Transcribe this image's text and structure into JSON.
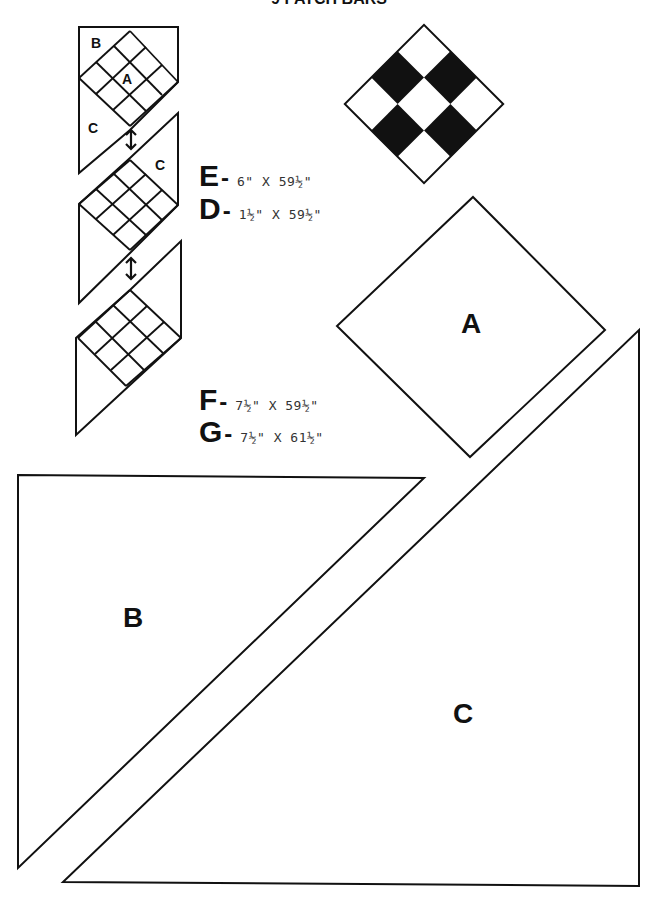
{
  "title": "9 PATCH BARS",
  "assembly_diagram": {
    "labels": {
      "b": "B",
      "a": "A",
      "c1": "C",
      "c2": "C"
    },
    "arrows": [
      "double-arrow",
      "double-arrow"
    ]
  },
  "nine_patch_block": {
    "grid": [
      [
        "white",
        "black",
        "white"
      ],
      [
        "black",
        "white",
        "black"
      ],
      [
        "white",
        "black",
        "white"
      ]
    ],
    "colors": {
      "dark": "#111111",
      "light": "#ffffff"
    }
  },
  "cut_list": [
    {
      "letter": "E",
      "dash": "-",
      "dimensions": "6\" X 59½\""
    },
    {
      "letter": "D",
      "dash": "-",
      "dimensions": "1½\" X 59½\""
    },
    {
      "letter": "F",
      "dash": "-",
      "dimensions": "7½\" X 59½\""
    },
    {
      "letter": "G",
      "dash": "-",
      "dimensions": "7½\" X 61½\""
    }
  ],
  "templates": {
    "a": {
      "label": "A"
    },
    "b": {
      "label": "B"
    },
    "c": {
      "label": "C"
    }
  }
}
